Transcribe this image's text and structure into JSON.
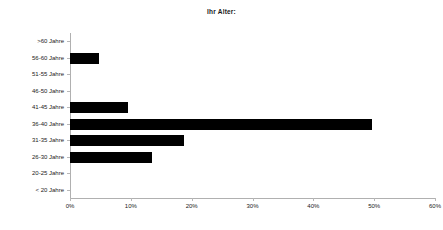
{
  "chart_data": {
    "type": "bar",
    "orientation": "horizontal",
    "title": "Ihr Alter:",
    "xlabel": "",
    "ylabel": "",
    "categories": [
      ">60 Jahre",
      "56-60 Jahre",
      "51-55 Jahre",
      "46-50 Jahre",
      "41-45 Jahre",
      "36-40 Jahre",
      "31-35 Jahre",
      "26-30 Jahre",
      "20-25 Jahre",
      "< 20 Jahre"
    ],
    "values": [
      0,
      4.8,
      0,
      0,
      9.5,
      49.7,
      18.8,
      13.5,
      0,
      0
    ],
    "value_suffix": "%",
    "xlim": [
      0,
      60
    ],
    "xticks": [
      0,
      10,
      20,
      30,
      40,
      50,
      60
    ],
    "xtick_labels": [
      "0%",
      "10%",
      "20%",
      "30%",
      "40%",
      "50%",
      "60%"
    ],
    "grid": false,
    "legend": false,
    "bar_color": "#000000",
    "background_color": "#ffffff",
    "axis_color": "#b0b0b0"
  }
}
